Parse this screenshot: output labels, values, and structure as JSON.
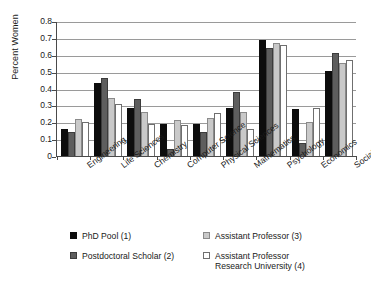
{
  "chart_data": {
    "type": "bar",
    "title": "",
    "xlabel": "",
    "ylabel": "Percent Women",
    "ylim": [
      0,
      0.8
    ],
    "ytick_labels": [
      "0.8",
      "0.7",
      "0.6",
      "0.5",
      "0.4",
      "0.3",
      "0.2",
      "0.1",
      "0"
    ],
    "ytick_values": [
      0.8,
      0.7,
      0.6,
      0.5,
      0.4,
      0.3,
      0.2,
      0.1,
      0
    ],
    "grid": true,
    "legend_position": "below",
    "categories": [
      "Engineering",
      "Life Sciences",
      "Chemistry",
      "Computer Science",
      "Physical Sciences",
      "Mathematics",
      "Psychology",
      "Economics",
      "Social Sciences"
    ],
    "series": [
      {
        "name": "PhD Pool (1)",
        "color": "#0d0d0d",
        "values": [
          0.16,
          0.43,
          0.285,
          0.19,
          0.19,
          0.285,
          0.69,
          0.28,
          0.505
        ]
      },
      {
        "name": "Postdoctoral Scholar (2)",
        "color": "#5e5e5e",
        "values": [
          0.14,
          0.46,
          0.34,
          0.04,
          0.14,
          0.38,
          0.64,
          0.08,
          0.61
        ]
      },
      {
        "name": "Assistant Professor (3)",
        "color": "#c9c9c9",
        "values": [
          0.22,
          0.345,
          0.26,
          0.215,
          0.225,
          0.26,
          0.67,
          0.2,
          0.55
        ]
      },
      {
        "name": "Assistant Professor Research University (4)",
        "color": "#ffffff",
        "values": [
          0.2,
          0.31,
          0.19,
          0.185,
          0.255,
          0.16,
          0.66,
          0.285,
          0.57
        ]
      }
    ]
  },
  "legend": {
    "entries": [
      {
        "label": "PhD Pool (1)",
        "line2": ""
      },
      {
        "label": "Assistant Professor (3)",
        "line2": ""
      },
      {
        "label": "Postdoctoral Scholar (2)",
        "line2": ""
      },
      {
        "label": "Assistant Professor",
        "line2": "Research University (4)"
      }
    ]
  }
}
